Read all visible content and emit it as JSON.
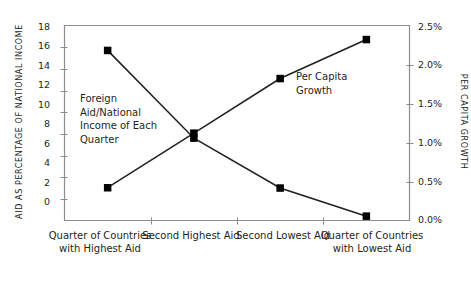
{
  "chart_data": {
    "type": "line",
    "title": "",
    "categories": [
      "Quarter of\nCountries with\nHighest Aid",
      "Second\nHighest Aid",
      "Second\nLowest Aid",
      "Quarter of\nCountries with\nLowest Aid"
    ],
    "series": [
      {
        "name": "Foreign Aid/National Income of Each Quarter",
        "axis": "left",
        "values": [
          15.7,
          7.6,
          3.0,
          0.4
        ]
      },
      {
        "name": "Per Capita Growth",
        "axis": "right",
        "values": [
          0.42,
          1.12,
          1.82,
          2.32
        ]
      }
    ],
    "left_axis": {
      "label": "AID AS PERCENTAGE OF NATIONAL INCOME",
      "ticks": [
        "18",
        "16",
        "14",
        "12",
        "10",
        "8",
        "6",
        "4",
        "2",
        "0"
      ],
      "tick_values": [
        18,
        16,
        14,
        12,
        10,
        8,
        6,
        4,
        2,
        0
      ],
      "ylim": [
        0,
        18
      ]
    },
    "right_axis": {
      "label": "PER CAPITA GROWTH",
      "ticks": [
        "2.5%",
        "2.0%",
        "1.5%",
        "1.0%",
        "0.5%",
        "0.0%"
      ],
      "tick_values": [
        2.5,
        2.0,
        1.5,
        1.0,
        0.5,
        0.0
      ],
      "ylim": [
        0,
        2.5
      ]
    },
    "annotations": [
      {
        "id": "aid-annotation",
        "text": "Foreign\nAid/National\nIncome of Each\nQuarter"
      },
      {
        "id": "growth-annotation",
        "text": "Per Capita\nGrowth"
      }
    ],
    "grid": false,
    "legend": "none",
    "colors": {
      "line": "#231f20",
      "marker": "#000000",
      "axis": "#8c8c8c",
      "text": "#231f20",
      "background": "#ffffff"
    }
  }
}
